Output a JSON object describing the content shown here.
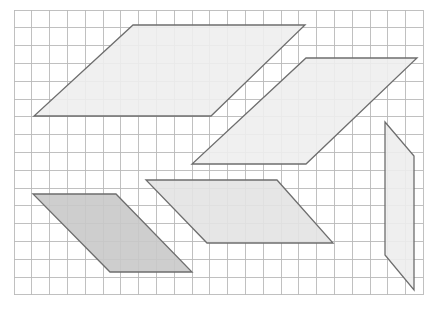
{
  "figure": {
    "canvas": {
      "width": 442,
      "height": 314,
      "background": "#ffffff"
    },
    "grid": {
      "label": "square grid",
      "x": 14,
      "y": 10,
      "cell_size": 17.8,
      "columns": 23,
      "rows": 16,
      "line_color": "#b9b9b9",
      "line_width": 0.9,
      "border_color": "#b9b9b9",
      "visible": true
    },
    "shapes": [
      {
        "name": "parallelogram-top-left",
        "type": "parallelogram",
        "points": "133,25 305,25 211,116 34,116",
        "fill": "#eeeeee",
        "fill_opacity": 0.9,
        "stroke": "#6e6e6e",
        "stroke_width": 1.3,
        "base_cells": 10,
        "height_cells": 5
      },
      {
        "name": "parallelogram-upper-right",
        "type": "parallelogram",
        "points": "306,58 417,58 306,164 192,164",
        "fill": "#eeeeee",
        "fill_opacity": 0.9,
        "stroke": "#6e6e6e",
        "stroke_width": 1.3,
        "base_cells": 6,
        "height_cells": 6
      },
      {
        "name": "parallelogram-middle-center",
        "type": "parallelogram",
        "points": "146,180 277,180 333,243 207,243",
        "fill": "#e3e3e3",
        "fill_opacity": 0.9,
        "stroke": "#6e6e6e",
        "stroke_width": 1.3,
        "base_cells": 7,
        "height_cells": 3.5
      },
      {
        "name": "parallelogram-bottom-left-dark",
        "type": "parallelogram",
        "points": "33,194 116,194 192,272 110,272",
        "fill": "#c9c9c9",
        "fill_opacity": 0.9,
        "stroke": "#6e6e6e",
        "stroke_width": 1.3,
        "base_cells": 4.5,
        "height_cells": 4.5
      },
      {
        "name": "parallelogram-right-thin",
        "type": "parallelogram",
        "points": "385,122 414,156 414,290 385,255",
        "fill": "#ededed",
        "fill_opacity": 0.9,
        "stroke": "#6e6e6e",
        "stroke_width": 1.3,
        "base_cells": 1.6,
        "height_cells": 7.5
      }
    ]
  }
}
